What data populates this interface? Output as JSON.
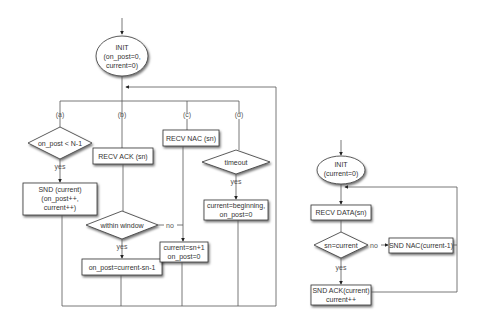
{
  "sender": {
    "init": {
      "line1": "INIT",
      "line2": "(on_post=0,",
      "line3": "current=0)"
    },
    "branches": {
      "a": "(a)",
      "b": "(b)",
      "c": "(c)",
      "d": "(d)"
    },
    "a_decision": "on_post < N-1",
    "a_yes": "yes",
    "a_action": {
      "line1": "SND (current)",
      "line2": "(on_post++,",
      "line3": "current++)"
    },
    "b_recv": "RECV ACK (sn)",
    "b_decision": "within window",
    "b_yes": "yes",
    "b_no": "no",
    "b_action": "on_post=current-sn-1",
    "c_recv": "RECV NAC (sn)",
    "c_action": {
      "line1": "current=sn+1",
      "line2": "on_post=0"
    },
    "d_decision": "timeout",
    "d_yes": "yes",
    "d_action": {
      "line1": "current=beginning,",
      "line2": "on_post=0"
    }
  },
  "receiver": {
    "init": {
      "line1": "INIT",
      "line2": "(current=0)"
    },
    "recv": "RECV DATA(sn)",
    "decision": "sn=current",
    "no": "no",
    "yes": "yes",
    "nac": "SND NAC(current-1)",
    "ack": {
      "line1": "SND ACK(current)",
      "line2": "current++"
    }
  }
}
